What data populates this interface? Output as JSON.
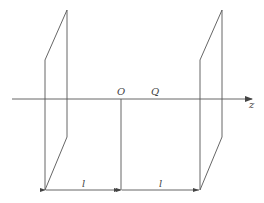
{
  "diagram": {
    "axis_label": "z",
    "origin_label": "O",
    "point_label": "Q",
    "dimension_left_label": "l",
    "dimension_right_label": "l",
    "stroke_color": "#555555",
    "background": "#ffffff"
  }
}
